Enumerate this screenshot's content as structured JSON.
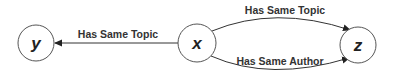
{
  "nodes": [
    {
      "id": "y",
      "label": "y"
    },
    {
      "id": "x",
      "label": "x"
    },
    {
      "id": "z",
      "label": "z"
    }
  ],
  "edges": [
    {
      "from": "x",
      "to": "y",
      "label": "Has Same Topic"
    },
    {
      "from": "x",
      "to": "z",
      "label": "Has Same Topic"
    },
    {
      "from": "x",
      "to": "z",
      "label": "Has Same Author"
    }
  ]
}
